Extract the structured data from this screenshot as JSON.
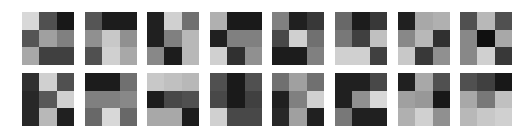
{
  "figure": {
    "rows": 2,
    "cols": 8,
    "kernel_size": 3,
    "layout": {
      "col_x": [
        22,
        85,
        147,
        210,
        272,
        335,
        398,
        460
      ],
      "row_y": [
        12,
        73
      ],
      "square_size": 52
    },
    "kernels": [
      {
        "row": 0,
        "col": 0,
        "cells": [
          "#d8d8d8",
          "#505050",
          "#181818",
          "#555555",
          "#a0a0a0",
          "#808080",
          "#a8a8a8",
          "#404040",
          "#404040"
        ]
      },
      {
        "row": 0,
        "col": 1,
        "cells": [
          "#555555",
          "#1c1c1c",
          "#1c1c1c",
          "#909090",
          "#c8c8c8",
          "#909090",
          "#505050",
          "#d0d0d0",
          "#a8a8a8"
        ]
      },
      {
        "row": 0,
        "col": 2,
        "cells": [
          "#202020",
          "#d0d0d0",
          "#707070",
          "#202020",
          "#808080",
          "#b8b8b8",
          "#888888",
          "#1c1c1c",
          "#b8b8b8"
        ]
      },
      {
        "row": 0,
        "col": 3,
        "cells": [
          "#b0b0b0",
          "#1a1a1a",
          "#1a1a1a",
          "#202020",
          "#808080",
          "#808080",
          "#d0d0d0",
          "#303030",
          "#909090"
        ]
      },
      {
        "row": 0,
        "col": 4,
        "cells": [
          "#808080",
          "#202020",
          "#383838",
          "#484848",
          "#d0d0d0",
          "#707070",
          "#1c1c1c",
          "#1c1c1c",
          "#808080"
        ]
      },
      {
        "row": 0,
        "col": 5,
        "cells": [
          "#686868",
          "#1c1c1c",
          "#383838",
          "#787878",
          "#404040",
          "#c0c0c0",
          "#d0d0d0",
          "#d0d0d0",
          "#404040"
        ]
      },
      {
        "row": 0,
        "col": 6,
        "cells": [
          "#202020",
          "#a8a8a8",
          "#b0b0b0",
          "#888888",
          "#b8b8b8",
          "#303030",
          "#c8c8c8",
          "#383838",
          "#909090"
        ]
      },
      {
        "row": 0,
        "col": 7,
        "cells": [
          "#505050",
          "#b8b8b8",
          "#505050",
          "#888888",
          "#101010",
          "#a8a8a8",
          "#888888",
          "#d0d0d0",
          "#383838"
        ]
      },
      {
        "row": 1,
        "col": 0,
        "cells": [
          "#303030",
          "#d0d0d0",
          "#505050",
          "#282828",
          "#585858",
          "#d0d0d0",
          "#282828",
          "#b8b8b8",
          "#202020"
        ]
      },
      {
        "row": 1,
        "col": 1,
        "cells": [
          "#1c1c1c",
          "#1c1c1c",
          "#707070",
          "#808080",
          "#808080",
          "#888888",
          "#686868",
          "#d8d8d8",
          "#686868"
        ]
      },
      {
        "row": 1,
        "col": 2,
        "cells": [
          "#c8c8c8",
          "#c0c0c0",
          "#b8b8b8",
          "#1c1c1c",
          "#484848",
          "#505050",
          "#a8a8a8",
          "#a8a8a8",
          "#1c1c1c"
        ]
      },
      {
        "row": 1,
        "col": 3,
        "cells": [
          "#505050",
          "#1a1a1a",
          "#505050",
          "#484848",
          "#1a1a1a",
          "#404040",
          "#d0d0d0",
          "#484848",
          "#484848"
        ]
      },
      {
        "row": 1,
        "col": 4,
        "cells": [
          "#707070",
          "#a0a0a0",
          "#707070",
          "#202020",
          "#808080",
          "#d0d0d0",
          "#282828",
          "#a0a0a0",
          "#202020"
        ]
      },
      {
        "row": 1,
        "col": 5,
        "cells": [
          "#202020",
          "#202020",
          "#484848",
          "#202020",
          "#909090",
          "#d8d8d8",
          "#787878",
          "#202020",
          "#202020"
        ]
      },
      {
        "row": 1,
        "col": 6,
        "cells": [
          "#202020",
          "#a8a8a8",
          "#505050",
          "#a0a0a0",
          "#989898",
          "#181818",
          "#b0b0b0",
          "#d0d0d0",
          "#909090"
        ]
      },
      {
        "row": 1,
        "col": 7,
        "cells": [
          "#505050",
          "#404040",
          "#181818",
          "#a8a8a8",
          "#787878",
          "#c0c0c0",
          "#b8b8b8",
          "#c8c8c8",
          "#d0d0d0"
        ]
      }
    ]
  }
}
